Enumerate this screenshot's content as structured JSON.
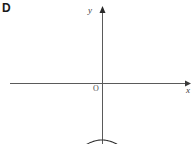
{
  "figure": {
    "choice_letter": "D",
    "background_color": "#ffffff",
    "stroke_color": "#333333",
    "axis_color": "#5a5a5a",
    "width": 192,
    "height": 144,
    "origin_label": "O",
    "x_axis_label": "x",
    "y_axis_label": "y"
  },
  "chart_data": {
    "type": "line",
    "title": "",
    "subtitle": "",
    "xlabel": "x",
    "ylabel": "y",
    "grid": false,
    "legend": null,
    "annotations": [
      "D",
      "O"
    ],
    "axes": {
      "origin_px": [
        102,
        83
      ],
      "x_axis_y_px": 83,
      "y_axis_x_px": 102,
      "x_axis_span_px": [
        10,
        190
      ],
      "y_axis_span_px": [
        8,
        144
      ],
      "x_arrow": "right",
      "y_arrow": "up",
      "ticks": [],
      "tick_labels": []
    },
    "series": [
      {
        "name": "parabola",
        "shape": "upward-opening parabola",
        "description": "Upward parabola with vertex below the x-axis on the y-axis, two x-intercepts symmetric about the origin",
        "vertex_px": [
          102,
          140
        ],
        "x_intercepts_px": [
          47,
          159
        ],
        "y_intercept_px": [
          102,
          140
        ],
        "endpoints_px": [
          [
            26,
            10
          ],
          [
            181,
            10
          ]
        ],
        "leading_coefficient_px": 0.0188,
        "curve_points_px": [
          [
            26,
            10
          ],
          [
            32,
            28
          ],
          [
            38,
            45
          ],
          [
            44,
            60
          ],
          [
            50,
            74
          ],
          [
            56,
            86
          ],
          [
            62,
            97
          ],
          [
            68,
            106
          ],
          [
            74,
            114
          ],
          [
            80,
            122
          ],
          [
            86,
            128
          ],
          [
            92,
            133
          ],
          [
            96,
            136
          ],
          [
            99,
            138
          ],
          [
            102,
            140
          ],
          [
            105,
            138
          ],
          [
            108,
            136
          ],
          [
            112,
            133
          ],
          [
            118,
            128
          ],
          [
            124,
            122
          ],
          [
            130,
            114
          ],
          [
            136,
            106
          ],
          [
            142,
            97
          ],
          [
            148,
            86
          ],
          [
            154,
            74
          ],
          [
            160,
            60
          ],
          [
            166,
            45
          ],
          [
            172,
            28
          ],
          [
            181,
            10
          ]
        ]
      }
    ]
  }
}
